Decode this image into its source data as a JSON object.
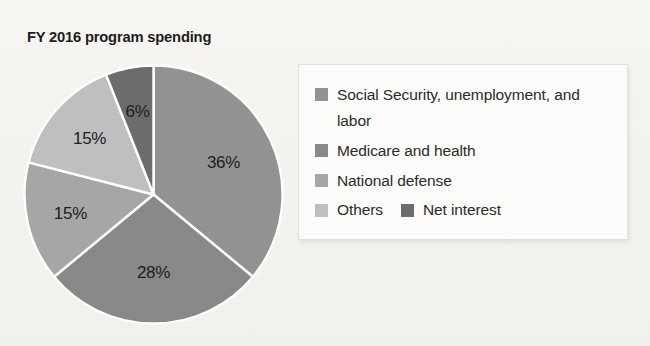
{
  "chart_data": {
    "type": "pie",
    "title": "FY 2016 program spending",
    "xlabel": "",
    "ylabel": "",
    "legend_position": "right",
    "grid": false,
    "unit": "percent",
    "categories": [
      "Social Security, unemployment, and labor",
      "Medicare and health",
      "National defense",
      "Others",
      "Net interest"
    ],
    "values": [
      36,
      28,
      15,
      15,
      6
    ],
    "slice_labels": [
      "36%",
      "28%",
      "15%",
      "15%",
      "6%"
    ],
    "slice_colors": [
      "#939393",
      "#898989",
      "#a7a7a7",
      "#c0c0c0",
      "#6d6d6d"
    ],
    "start_angle_deg": 0,
    "direction": "clockwise"
  },
  "title": {
    "text": "FY 2016 program spending"
  },
  "pie": {
    "slices": [
      {
        "label": "36%",
        "value": 36,
        "color": "#939393",
        "name": "social-security"
      },
      {
        "label": "28%",
        "value": 28,
        "color": "#898989",
        "name": "medicare-health"
      },
      {
        "label": "15%",
        "value": 15,
        "color": "#a7a7a7",
        "name": "national-defense"
      },
      {
        "label": "15%",
        "value": 15,
        "color": "#c0c0c0",
        "name": "others"
      },
      {
        "label": "6%",
        "value": 6,
        "color": "#6d6d6d",
        "name": "net-interest"
      }
    ]
  },
  "legend": {
    "items": [
      {
        "label": "Social Security, unemployment, and labor",
        "color": "#939393"
      },
      {
        "label": "Medicare and health",
        "color": "#898989"
      },
      {
        "label": "National defense",
        "color": "#a7a7a7"
      },
      {
        "label": "Others",
        "color": "#c0c0c0"
      },
      {
        "label": "Net interest",
        "color": "#6d6d6d"
      }
    ]
  }
}
